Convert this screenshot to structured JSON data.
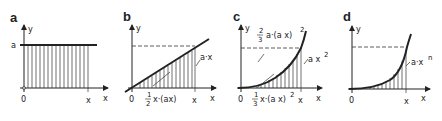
{
  "figure": {
    "panels": [
      {
        "id": "a",
        "letter": "a",
        "y_axis_label": "y",
        "x_axis_label": "x",
        "origin_label": "0",
        "x_tick_label": "x",
        "y_value_label": "a",
        "function": "y = a (constant)",
        "shaded_area": "a·x"
      },
      {
        "id": "b",
        "letter": "b",
        "y_axis_label": "y",
        "x_axis_label": "x",
        "origin_label": "0",
        "x_tick_label": "x",
        "curve_label": "a·x",
        "area_label_frac_num": "1",
        "area_label_frac_den": "2",
        "area_label_rest": "x·(ax)"
      },
      {
        "id": "c",
        "letter": "c",
        "y_axis_label": "y",
        "x_axis_label": "x",
        "origin_label": "0",
        "x_tick_label": "x",
        "curve_label_base": "a x",
        "curve_label_exp": "2",
        "upper_area_frac_num": "2",
        "upper_area_frac_den": "3",
        "upper_area_rest": "a·(a x)",
        "upper_area_exp": "2",
        "lower_area_frac_num": "1",
        "lower_area_frac_den": "3",
        "lower_area_rest": "x·(a x)",
        "lower_area_exp": "2"
      },
      {
        "id": "d",
        "letter": "d",
        "y_axis_label": "y",
        "x_axis_label": "x",
        "origin_label": "0",
        "x_tick_label": "x",
        "curve_label_base": "a·x",
        "curve_label_exp": "n"
      }
    ]
  }
}
